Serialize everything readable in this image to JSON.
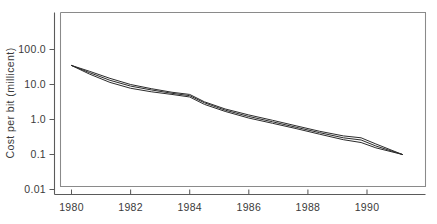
{
  "chart_data": {
    "type": "line",
    "title": "",
    "subtitle": "",
    "xlabel": "",
    "ylabel": "Cost per bit (millicent)",
    "yscale": "log",
    "xscale": "linear",
    "grid": false,
    "legend": false,
    "legend_position": "none",
    "xlim": [
      1979.2,
      1991.6
    ],
    "ylim": [
      0.01,
      300
    ],
    "xticks": [
      1980,
      1982,
      1984,
      1986,
      1988,
      1990
    ],
    "xtick_labels": [
      "1980",
      "1982",
      "1984",
      "1986",
      "1988",
      "1990"
    ],
    "yticks": [
      100.0,
      10.0,
      1.0,
      0.1,
      0.01
    ],
    "ytick_labels": [
      "100.0",
      "10.0",
      "1.0",
      "0.1",
      "0.01"
    ],
    "line_color": "#2b2b2b",
    "axis_color": "#5a5a5a",
    "series": [
      {
        "name": "series-1",
        "x": [
          1980.0,
          1980.6,
          1981.3,
          1982.0,
          1982.7,
          1983.4,
          1984.0,
          1984.5,
          1985.2,
          1986.0,
          1986.8,
          1987.6,
          1988.4,
          1989.2,
          1989.8,
          1990.3,
          1991.2
        ],
        "values": [
          35.0,
          24.0,
          15.0,
          10.0,
          7.6,
          6.0,
          5.2,
          3.2,
          2.0,
          1.35,
          0.95,
          0.66,
          0.46,
          0.34,
          0.3,
          0.2,
          0.1
        ]
      },
      {
        "name": "series-2",
        "x": [
          1980.0,
          1980.6,
          1981.3,
          1982.0,
          1982.7,
          1983.4,
          1984.0,
          1984.5,
          1985.2,
          1986.0,
          1986.8,
          1987.6,
          1988.4,
          1989.2,
          1989.8,
          1990.3,
          1991.2
        ],
        "values": [
          35.0,
          22.0,
          13.2,
          9.0,
          7.0,
          5.6,
          4.8,
          3.0,
          1.85,
          1.22,
          0.86,
          0.6,
          0.42,
          0.3,
          0.26,
          0.175,
          0.1
        ]
      },
      {
        "name": "series-3",
        "x": [
          1980.0,
          1980.6,
          1981.3,
          1982.0,
          1982.7,
          1983.4,
          1984.0,
          1984.5,
          1985.2,
          1986.0,
          1986.8,
          1987.6,
          1988.4,
          1989.2,
          1989.8,
          1990.3,
          1991.2
        ],
        "values": [
          35.0,
          20.0,
          11.5,
          7.8,
          6.2,
          5.2,
          4.4,
          2.7,
          1.7,
          1.1,
          0.78,
          0.55,
          0.38,
          0.265,
          0.22,
          0.155,
          0.1
        ]
      }
    ],
    "annotations": []
  },
  "axis": {
    "y_title": "Cost per bit (millicent)",
    "x_tick_1": "1980",
    "x_tick_2": "1982",
    "x_tick_3": "1984",
    "x_tick_4": "1986",
    "x_tick_5": "1988",
    "x_tick_6": "1990",
    "y_tick_1": "100.0",
    "y_tick_2": "10.0",
    "y_tick_3": "1.0",
    "y_tick_4": "0.1",
    "y_tick_5": "0.01"
  }
}
